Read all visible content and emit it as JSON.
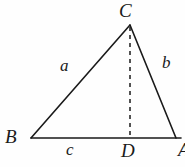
{
  "figure": {
    "type": "geometry-diagram",
    "stroke_color": "#1a1a1a",
    "background_color": "#fefefe",
    "vertices": [
      {
        "name": "C",
        "label": "C",
        "x": 130,
        "y": 25
      },
      {
        "name": "B",
        "label": "B",
        "x": 31,
        "y": 138
      },
      {
        "name": "A",
        "label": "A",
        "x": 176,
        "y": 138
      },
      {
        "name": "D",
        "label": "D",
        "x": 130,
        "y": 138
      }
    ],
    "sides": [
      {
        "name": "side-a",
        "label": "a",
        "from": "B",
        "to": "C"
      },
      {
        "name": "side-b",
        "label": "b",
        "from": "C",
        "to": "A"
      },
      {
        "name": "side-c",
        "label": "c",
        "from": "B",
        "to": "A"
      }
    ],
    "altitude": {
      "name": "altitude-CD",
      "from": "C",
      "to": "D",
      "style": "dashed"
    }
  }
}
